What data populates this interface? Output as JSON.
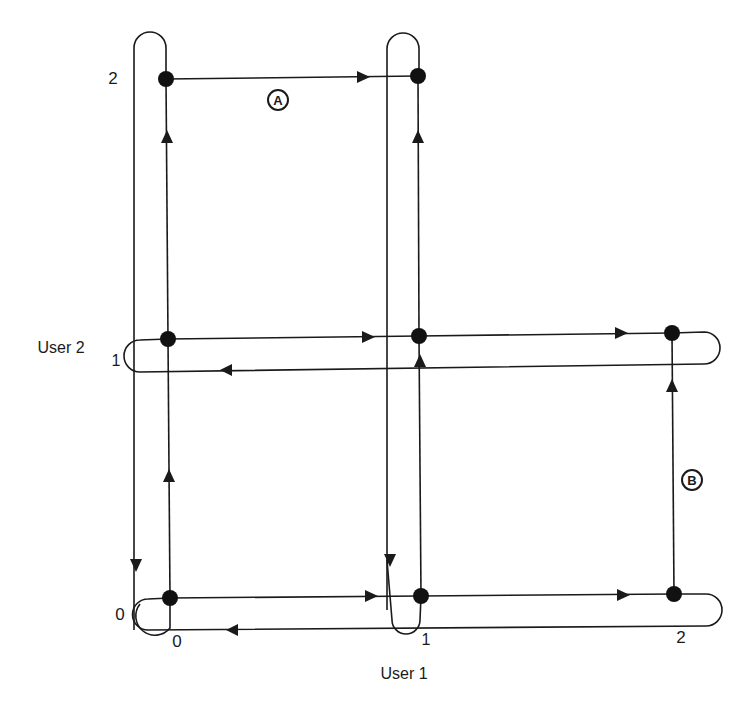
{
  "diagram": {
    "axis_x": {
      "label": "User 1",
      "ticks": [
        "0",
        "1",
        "2"
      ]
    },
    "axis_y": {
      "label": "User 2",
      "ticks": [
        "0",
        "1",
        "2"
      ]
    },
    "annotations": {
      "a": "A",
      "b": "B"
    },
    "nodes": [
      {
        "id": "0,0",
        "x": 170,
        "y": 598
      },
      {
        "id": "1,0",
        "x": 421,
        "y": 596
      },
      {
        "id": "2,0",
        "x": 674,
        "y": 594
      },
      {
        "id": "0,1",
        "x": 168,
        "y": 339
      },
      {
        "id": "1,1",
        "x": 419,
        "y": 336
      },
      {
        "id": "2,1",
        "x": 672,
        "y": 333
      },
      {
        "id": "0,2",
        "x": 166,
        "y": 79
      },
      {
        "id": "1,2",
        "x": 418,
        "y": 76
      }
    ],
    "edges": [
      {
        "from": "0,0",
        "to": "0,1",
        "direction": "up"
      },
      {
        "from": "0,1",
        "to": "0,2",
        "direction": "up"
      },
      {
        "from": "1,0",
        "to": "1,1",
        "direction": "up"
      },
      {
        "from": "1,1",
        "to": "1,2",
        "direction": "up"
      },
      {
        "from": "2,0",
        "to": "2,1",
        "direction": "up",
        "label": "B"
      },
      {
        "from": "0,0",
        "to": "1,0",
        "direction": "right"
      },
      {
        "from": "1,0",
        "to": "2,0",
        "direction": "right"
      },
      {
        "from": "0,1",
        "to": "1,1",
        "direction": "right"
      },
      {
        "from": "1,1",
        "to": "2,1",
        "direction": "right"
      },
      {
        "from": "0,2",
        "to": "1,2",
        "direction": "right",
        "label": "A"
      }
    ],
    "loops": [
      {
        "name": "user1-state0-vertical-loop",
        "return_direction": "down"
      },
      {
        "name": "user1-state1-vertical-loop",
        "return_direction": "down"
      },
      {
        "name": "user2-state0-horizontal-loop",
        "return_direction": "left"
      },
      {
        "name": "user2-state1-horizontal-loop",
        "return_direction": "left"
      }
    ]
  }
}
